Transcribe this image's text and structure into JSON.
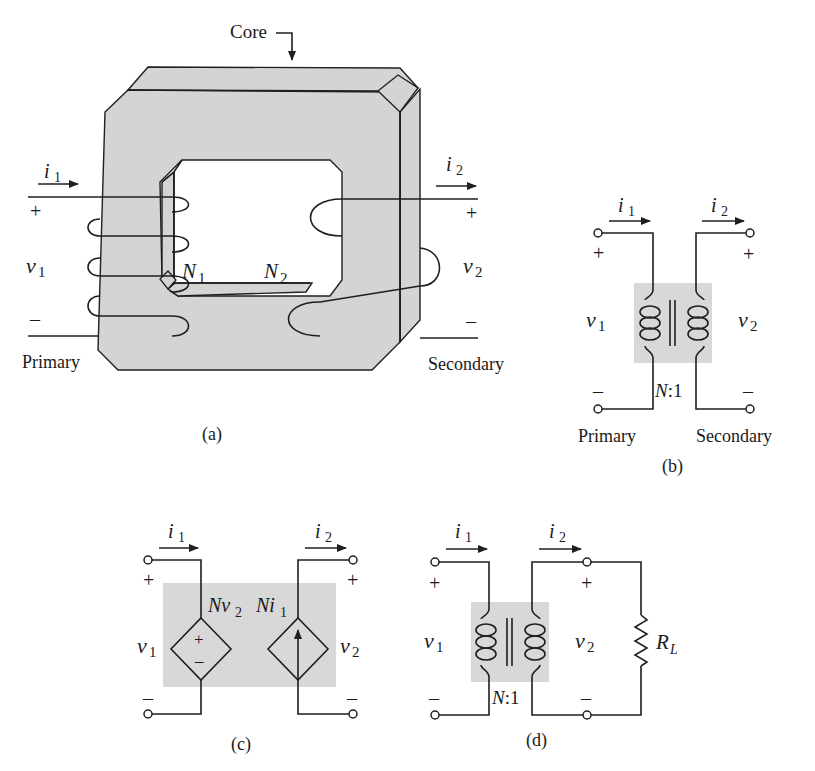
{
  "figure": {
    "panel_a": {
      "caption": "(a)",
      "core_label": "Core",
      "primary_label": "Primary",
      "secondary_label": "Secondary",
      "current_in": {
        "sym": "i",
        "sub": "1"
      },
      "current_out": {
        "sym": "i",
        "sub": "2"
      },
      "v1": {
        "sym": "v",
        "sub": "1"
      },
      "v2": {
        "sym": "v",
        "sub": "2"
      },
      "n1": {
        "sym": "N",
        "sub": "1"
      },
      "n2": {
        "sym": "N",
        "sub": "2"
      },
      "plus": "+",
      "minus": "–"
    },
    "panel_b": {
      "caption": "(b)",
      "primary_label": "Primary",
      "secondary_label": "Secondary",
      "i1": {
        "sym": "i",
        "sub": "1"
      },
      "i2": {
        "sym": "i",
        "sub": "2"
      },
      "v1": {
        "sym": "v",
        "sub": "1"
      },
      "v2": {
        "sym": "v",
        "sub": "2"
      },
      "ratio": {
        "sym": "N",
        "rest": ":1"
      },
      "plus": "+",
      "minus": "–"
    },
    "panel_c": {
      "caption": "(c)",
      "i1": {
        "sym": "i",
        "sub": "1"
      },
      "i2": {
        "sym": "i",
        "sub": "2"
      },
      "v1": {
        "sym": "v",
        "sub": "1"
      },
      "v2": {
        "sym": "v",
        "sub": "2"
      },
      "dep_voltage": {
        "sym": "Nv",
        "sub": "2"
      },
      "dep_current": {
        "sym": "Ni",
        "sub": "1"
      },
      "plus": "+",
      "minus": "–"
    },
    "panel_d": {
      "caption": "(d)",
      "i1": {
        "sym": "i",
        "sub": "1"
      },
      "i2": {
        "sym": "i",
        "sub": "2"
      },
      "v1": {
        "sym": "v",
        "sub": "1"
      },
      "v2": {
        "sym": "v",
        "sub": "2"
      },
      "ratio": {
        "sym": "N",
        "rest": ":1"
      },
      "load": {
        "sym": "R",
        "sub": "L"
      },
      "plus": "+",
      "minus": "–"
    }
  }
}
